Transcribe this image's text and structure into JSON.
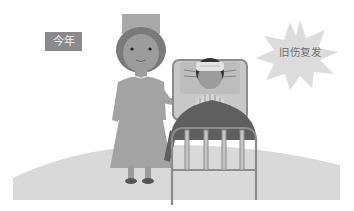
{
  "scene": {
    "description": "Illustration: nurse standing beside a hospital bed where a patient with a bandaged head lies",
    "year_label": "今年",
    "burst_caption": "旧伤复发"
  },
  "colors": {
    "background": "#ffffff",
    "ground": "#d9d9d9",
    "label_box": "#8a8a8a",
    "label_text": "#f4f4f4",
    "burst": "#dcdcdc",
    "burst_text": "#6e6e6e",
    "nurse_body": "#a3a3a3",
    "nurse_hair": "#7a7a7a",
    "skin": "#9c9c9c",
    "blanket": "#5f5f5f",
    "bed_frame": "#8c8c8c",
    "pillow": "#bdbdbd"
  }
}
